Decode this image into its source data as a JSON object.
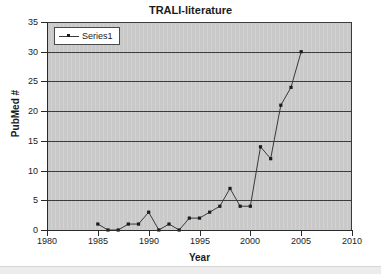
{
  "chart_data": {
    "type": "line",
    "title": "TRALI-literature",
    "xlabel": "Year",
    "ylabel": "PubMed #",
    "xlim": [
      1980,
      2010
    ],
    "ylim": [
      0,
      35
    ],
    "xticks": [
      1980,
      1985,
      1990,
      1995,
      2000,
      2005,
      2010
    ],
    "yticks": [
      0,
      5,
      10,
      15,
      20,
      25,
      30,
      35
    ],
    "grid": "horizontal",
    "legend_position": "top-left",
    "plot_background": "#c9c9c9",
    "series_color": "#3a3a3a",
    "marker_color": "#1b1b1b",
    "series": [
      {
        "name": "Series1",
        "x": [
          1985,
          1986,
          1987,
          1988,
          1989,
          1990,
          1991,
          1992,
          1993,
          1994,
          1995,
          1996,
          1997,
          1998,
          1999,
          2000,
          2001,
          2002,
          2003,
          2004,
          2005
        ],
        "values": [
          1,
          0,
          0,
          1,
          1,
          3,
          0,
          1,
          0,
          2,
          2,
          3,
          4,
          7,
          4,
          4,
          14,
          12,
          21,
          24,
          30
        ]
      }
    ]
  },
  "legend": {
    "entries": [
      {
        "label": "Series1"
      }
    ]
  }
}
